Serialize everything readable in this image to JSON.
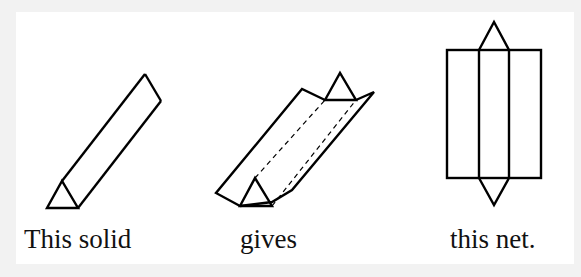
{
  "diagram": {
    "type": "geometry-net-illustration",
    "captions": {
      "solid": "This solid",
      "unfolded": "gives",
      "net": "this net."
    },
    "figures": [
      {
        "id": "solid",
        "description": "Triangular prism drawn diagonally, triangular end face at bottom-left"
      },
      {
        "id": "unfolded",
        "description": "Prism being unfolded: lateral faces opening with dashed fold lines and triangular end caps"
      },
      {
        "id": "net",
        "description": "Net of three vertical rectangles side by side with a triangle attached above and below the middle rectangle"
      }
    ],
    "colors": {
      "background": "#f2f2f2",
      "panel": "#ffffff",
      "stroke": "#000000",
      "text": "#111111"
    }
  }
}
